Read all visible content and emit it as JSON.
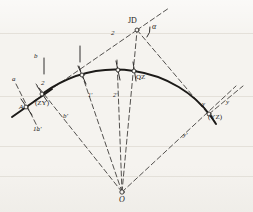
{
  "figure": {
    "type": "geometry-diagram",
    "background_color": "#f5f3ef",
    "ink_color": "#1c1a18",
    "width": 253,
    "height": 212
  },
  "labels": {
    "jd": "JD",
    "alpha": "α",
    "zy_point": "A",
    "zy_paren": "(ZY)",
    "yz_point": "y",
    "yz_paren": "(YZ)",
    "qz": "QZ",
    "center": "O",
    "tangent_a": "a",
    "tangent_b": "b",
    "chord_b_prime": "b′",
    "chord_1a_prime": "1a′",
    "ray_1_prime": "1′",
    "ray_2_prime": "2′",
    "node_2_left": "2",
    "node_2_top": "2",
    "axis_y": "y",
    "axis_y_prime": "y′"
  },
  "points": {
    "ZY": {
      "x": 42,
      "y": 94,
      "name": "curve-start-ZY"
    },
    "QZ": {
      "x": 134,
      "y": 71,
      "name": "curve-midpoint-QZ"
    },
    "YZ": {
      "x": 209,
      "y": 114,
      "name": "curve-end-YZ"
    },
    "JD": {
      "x": 137,
      "y": 30,
      "name": "intersection-point-JD"
    },
    "O": {
      "x": 122,
      "y": 192,
      "name": "curve-center-O"
    },
    "P1": {
      "x": 82,
      "y": 75,
      "name": "curve-node-1"
    },
    "P2": {
      "x": 118,
      "y": 70,
      "name": "curve-node-2"
    },
    "A": {
      "x": 26,
      "y": 107,
      "name": "tangent-node-A"
    }
  },
  "elements": {
    "curve": "solid circular arc from ZY through QZ to YZ",
    "tangent_line": "solid straight tangent through ZY extending lower-left",
    "dashed_rays": "radial dashed lines from center O to curve nodes",
    "dashed_chords": "dashed chords from ZY to curve nodes",
    "angle_marker": "arc at JD marking deflection angle alpha"
  }
}
